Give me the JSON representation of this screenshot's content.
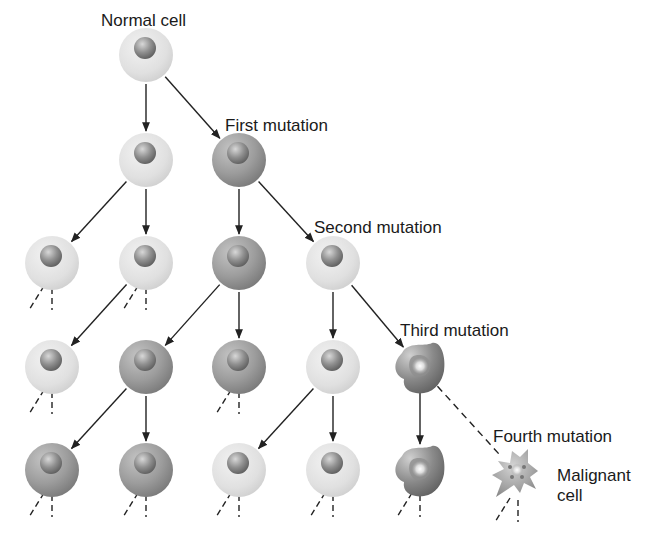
{
  "labels": {
    "normal": "Normal cell",
    "first": "First mutation",
    "second": "Second mutation",
    "third": "Third mutation",
    "fourth": "Fourth mutation",
    "malignant_line1": "Malignant",
    "malignant_line2": "cell"
  },
  "colors": {
    "light_cell": "#e4e4e4",
    "dark_cell": "#9a9a9a",
    "nucleus": "#8a8a8a",
    "arrow": "#222222",
    "text": "#1a1a1a"
  },
  "cells": [
    {
      "id": "c0",
      "row": 0,
      "x": 146,
      "y": 55,
      "type": "light"
    },
    {
      "id": "c1a",
      "row": 1,
      "x": 146,
      "y": 160,
      "type": "light"
    },
    {
      "id": "c1b",
      "row": 1,
      "x": 239,
      "y": 160,
      "type": "dark"
    },
    {
      "id": "c2a",
      "row": 2,
      "x": 52,
      "y": 263,
      "type": "light"
    },
    {
      "id": "c2b",
      "row": 2,
      "x": 146,
      "y": 263,
      "type": "light"
    },
    {
      "id": "c2c",
      "row": 2,
      "x": 239,
      "y": 263,
      "type": "dark"
    },
    {
      "id": "c2d",
      "row": 2,
      "x": 333,
      "y": 263,
      "type": "light"
    },
    {
      "id": "c3a",
      "row": 3,
      "x": 52,
      "y": 367,
      "type": "light"
    },
    {
      "id": "c3b",
      "row": 3,
      "x": 146,
      "y": 367,
      "type": "dark"
    },
    {
      "id": "c3c",
      "row": 3,
      "x": 239,
      "y": 367,
      "type": "dark"
    },
    {
      "id": "c3d",
      "row": 3,
      "x": 333,
      "y": 367,
      "type": "light"
    },
    {
      "id": "c3e",
      "row": 3,
      "x": 420,
      "y": 367,
      "type": "irregular"
    },
    {
      "id": "c4a",
      "row": 4,
      "x": 52,
      "y": 470,
      "type": "dark"
    },
    {
      "id": "c4b",
      "row": 4,
      "x": 146,
      "y": 470,
      "type": "dark"
    },
    {
      "id": "c4c",
      "row": 4,
      "x": 239,
      "y": 470,
      "type": "light"
    },
    {
      "id": "c4d",
      "row": 4,
      "x": 333,
      "y": 470,
      "type": "light"
    },
    {
      "id": "c4e",
      "row": 4,
      "x": 420,
      "y": 470,
      "type": "irregular"
    },
    {
      "id": "c4f",
      "row": 4,
      "x": 518,
      "y": 475,
      "type": "malignant"
    }
  ],
  "arrows": [
    {
      "from": "c0",
      "to": "c1a",
      "style": "solid"
    },
    {
      "from": "c0",
      "to": "c1b",
      "style": "solid"
    },
    {
      "from": "c1a",
      "to": "c2a",
      "style": "solid"
    },
    {
      "from": "c1a",
      "to": "c2b",
      "style": "solid"
    },
    {
      "from": "c1b",
      "to": "c2c",
      "style": "solid"
    },
    {
      "from": "c1b",
      "to": "c2d",
      "style": "solid"
    },
    {
      "from": "c2b",
      "to": "c3a",
      "style": "solid"
    },
    {
      "from": "c2c",
      "to": "c3b",
      "style": "solid"
    },
    {
      "from": "c2c",
      "to": "c3c",
      "style": "solid"
    },
    {
      "from": "c2d",
      "to": "c3d",
      "style": "solid"
    },
    {
      "from": "c2d",
      "to": "c3e",
      "style": "solid"
    },
    {
      "from": "c3b",
      "to": "c4a",
      "style": "solid"
    },
    {
      "from": "c3b",
      "to": "c4b",
      "style": "solid"
    },
    {
      "from": "c3d",
      "to": "c4c",
      "style": "solid"
    },
    {
      "from": "c3d",
      "to": "c4d",
      "style": "solid"
    },
    {
      "from": "c3e",
      "to": "c4e",
      "style": "solid"
    },
    {
      "from": "c3e",
      "to": "c4f",
      "style": "dashed"
    }
  ],
  "terminal_stubs": [
    "c2a",
    "c2b",
    "c3a",
    "c3c",
    "c4a",
    "c4b",
    "c4c",
    "c4d",
    "c4e",
    "c4f"
  ]
}
